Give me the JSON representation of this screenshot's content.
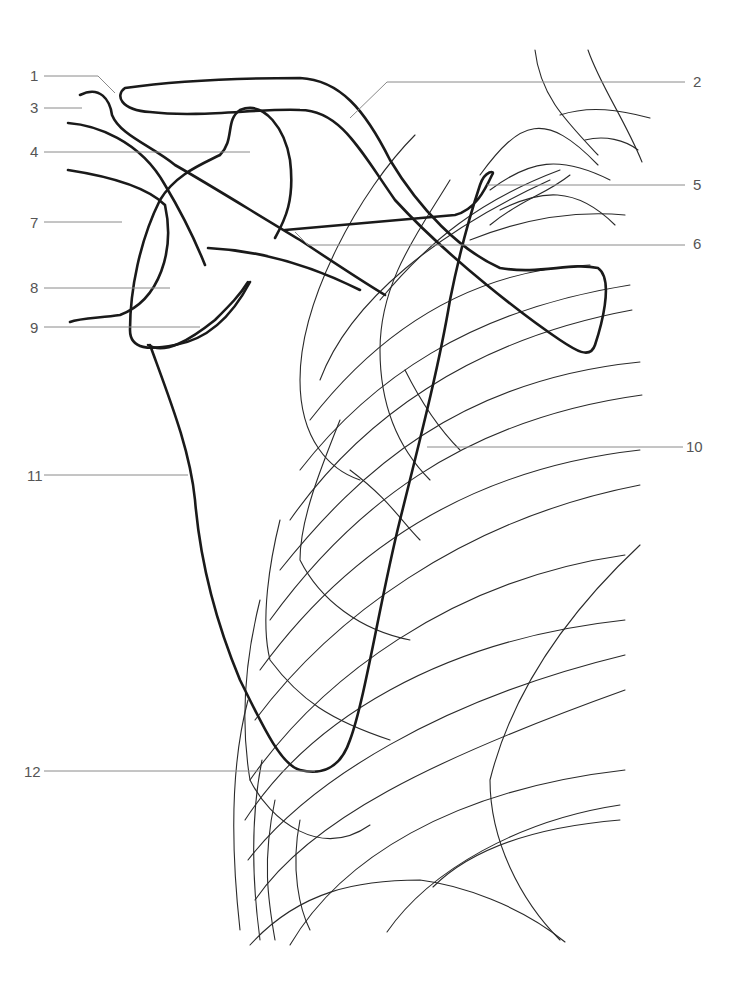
{
  "figure": {
    "type": "anatomical line drawing",
    "colors": {
      "bone_outline": "#1a1a1a",
      "ribs": "#2a2a2a",
      "leader_lines": "#8a8a8a",
      "label_text": "#555555",
      "background": "#ffffff"
    }
  },
  "labels": [
    {
      "id": "1",
      "text": "1",
      "x": 32,
      "y": 75
    },
    {
      "id": "2",
      "text": "2",
      "x": 695,
      "y": 80
    },
    {
      "id": "3",
      "text": "3",
      "x": 32,
      "y": 107
    },
    {
      "id": "4",
      "text": "4",
      "x": 32,
      "y": 152
    },
    {
      "id": "5",
      "text": "5",
      "x": 695,
      "y": 185
    },
    {
      "id": "6",
      "text": "6",
      "x": 695,
      "y": 243
    },
    {
      "id": "7",
      "text": "7",
      "x": 32,
      "y": 222
    },
    {
      "id": "8",
      "text": "8",
      "x": 32,
      "y": 288
    },
    {
      "id": "9",
      "text": "9",
      "x": 32,
      "y": 327
    },
    {
      "id": "10",
      "text": "10",
      "x": 688,
      "y": 446
    },
    {
      "id": "11",
      "text": "11",
      "x": 28,
      "y": 475
    },
    {
      "id": "12",
      "text": "12",
      "x": 25,
      "y": 771
    }
  ]
}
